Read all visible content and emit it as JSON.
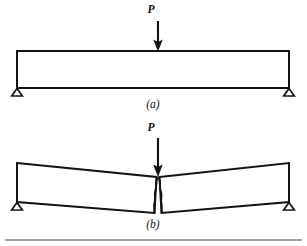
{
  "figure": {
    "background_color": "#ffffff",
    "ink_color": "#131313",
    "width": 307,
    "height": 246,
    "panels": [
      {
        "id": "a",
        "caption": "(a)",
        "description": "Simply supported beam with central point load, undeformed",
        "load_label": "P",
        "load_arrow": {
          "x": 158,
          "top_y": 21,
          "tip_y": 51,
          "direction": "down"
        },
        "label_position": {
          "x": 151,
          "y": 13
        },
        "caption_position": {
          "x": 153,
          "y": 108
        },
        "beam": {
          "left": 17,
          "right": 289,
          "top": 51,
          "bottom": 88
        },
        "supports": [
          {
            "name": "left-roller-support",
            "cx": 17,
            "cy": 88
          },
          {
            "name": "right-roller-support",
            "cx": 289,
            "cy": 88
          }
        ]
      },
      {
        "id": "b",
        "caption": "(b)",
        "description": "Same beam after flexural failure: hinge forms at midspan with a vertical crack opening from the tension face",
        "load_label": "P",
        "load_arrow": {
          "x": 158,
          "top_y": 138,
          "tip_y": 176,
          "direction": "down"
        },
        "label_position": {
          "x": 151,
          "y": 131
        },
        "caption_position": {
          "x": 153,
          "y": 228
        },
        "beam": {
          "left": 17,
          "right": 289,
          "midspan_x": 158,
          "left_top_y": 163,
          "mid_top_y": 177,
          "right_top_y": 163,
          "left_bottom_y": 202,
          "mid_bottom_y": 213,
          "right_bottom_y": 202
        },
        "supports": [
          {
            "name": "left-roller-support",
            "cx": 17,
            "cy": 202
          },
          {
            "name": "right-roller-support",
            "cx": 289,
            "cy": 202
          }
        ],
        "crack": {
          "name": "flexural-crack",
          "top_y": 177,
          "bottom_y": 213,
          "style": "wavy-vertical-pair"
        }
      }
    ],
    "baseline_rule": {
      "name": "page-rule",
      "x1": 5,
      "x2": 302,
      "y": 240,
      "color": "#4a4a4a"
    }
  }
}
